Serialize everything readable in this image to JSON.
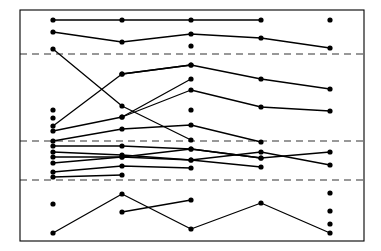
{
  "chart_data": {
    "type": "line",
    "title": "",
    "subtitle": "",
    "xlabel": "",
    "ylabel": "",
    "grid": true,
    "legend": "none",
    "axis_frame": true,
    "x": [
      1,
      2,
      3,
      4,
      5
    ],
    "x_pixels": [
      53,
      122,
      191,
      261,
      330
    ],
    "xlim": [
      0,
      6
    ],
    "ylim": [
      0,
      100
    ],
    "plot_box_pixels": {
      "left": 20,
      "top": 10,
      "right": 364,
      "bottom": 241
    },
    "gridlines": {
      "style": "dashed",
      "color": "#333333",
      "y_values": [
        81,
        43,
        26
      ],
      "y_pixels": [
        54,
        141,
        180
      ]
    },
    "marker": {
      "shape": "circle",
      "color": "#000000",
      "radius": 2.6
    },
    "line": {
      "color": "#000000",
      "width": 1.3
    },
    "series": [
      {
        "name": "S1",
        "x": [
          1,
          2,
          3,
          4
        ],
        "y_pixels": [
          20,
          20,
          20,
          20
        ]
      },
      {
        "name": "S2",
        "x": [
          1,
          2,
          3,
          4,
          5
        ],
        "y_pixels": [
          32,
          42,
          34,
          38,
          48
        ]
      },
      {
        "name": "S3",
        "x": [
          1,
          2,
          3
        ],
        "y_pixels": [
          49,
          106,
          140
        ]
      },
      {
        "name": "S4",
        "x": [
          2,
          3,
          4,
          5
        ],
        "y_pixels": [
          74,
          65,
          79,
          89
        ]
      },
      {
        "name": "S5",
        "x": [
          1,
          2,
          3
        ],
        "y_pixels": [
          126,
          74,
          65
        ]
      },
      {
        "name": "S6",
        "x": [
          2,
          3,
          4,
          5
        ],
        "y_pixels": [
          117,
          90,
          107,
          111
        ]
      },
      {
        "name": "S7",
        "x": [
          1,
          2,
          3
        ],
        "y_pixels": [
          131,
          117,
          79
        ]
      },
      {
        "name": "S8",
        "x": [
          1,
          2,
          3,
          4
        ],
        "y_pixels": [
          141,
          129,
          125,
          142
        ]
      },
      {
        "name": "S9",
        "x": [
          1,
          2,
          3,
          4,
          5
        ],
        "y_pixels": [
          146,
          146,
          149,
          158,
          152
        ]
      },
      {
        "name": "S10",
        "x": [
          1,
          2,
          3,
          4,
          5
        ],
        "y_pixels": [
          152,
          155,
          160,
          152,
          165
        ]
      },
      {
        "name": "S11",
        "x": [
          1,
          2,
          3,
          4
        ],
        "y_pixels": [
          157,
          157,
          149,
          158
        ]
      },
      {
        "name": "S12",
        "x": [
          1,
          2,
          3,
          4
        ],
        "y_pixels": [
          163,
          157,
          160,
          167
        ]
      },
      {
        "name": "S13",
        "x": [
          1,
          2,
          3
        ],
        "y_pixels": [
          172,
          166,
          168
        ]
      },
      {
        "name": "S14",
        "x": [
          1,
          2
        ],
        "y_pixels": [
          177,
          175
        ]
      },
      {
        "name": "S15",
        "x": [
          1,
          2,
          3,
          4,
          5
        ],
        "y_pixels": [
          233,
          194,
          229,
          203,
          233
        ]
      },
      {
        "name": "S16",
        "x": [
          2,
          3
        ],
        "y_pixels": [
          212,
          200
        ]
      }
    ],
    "isolated_points": [
      {
        "x": 1,
        "y_pixel": 110
      },
      {
        "x": 1,
        "y_pixel": 118
      },
      {
        "x": 1,
        "y_pixel": 204
      },
      {
        "x": 3,
        "y_pixel": 46
      },
      {
        "x": 3,
        "y_pixel": 110
      },
      {
        "x": 5,
        "y_pixel": 20
      },
      {
        "x": 5,
        "y_pixel": 193
      },
      {
        "x": 5,
        "y_pixel": 211
      },
      {
        "x": 5,
        "y_pixel": 224
      }
    ]
  }
}
